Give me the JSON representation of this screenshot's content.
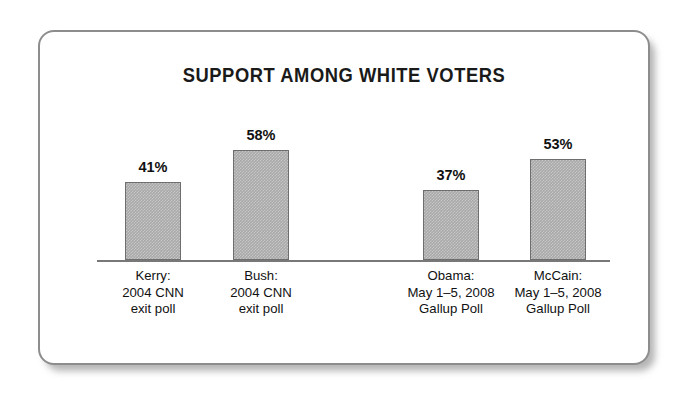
{
  "card": {
    "border_color": "#8d8d8d",
    "background": "#ffffff"
  },
  "chart_data": {
    "type": "bar",
    "title": "SUPPORT AMONG WHITE VOTERS",
    "xlabel": "",
    "ylabel": "",
    "ylim": [
      0,
      65
    ],
    "grid": false,
    "legend": "none",
    "bar_color": "#a9a9a9",
    "bar_border_color": "#6e6e6e",
    "axis_color": "#787878",
    "categories": [
      "Kerry: 2004 CNN exit poll",
      "Bush: 2004 CNN exit poll",
      "Obama: May 1–5, 2008 Gallup Poll",
      "McCain: May 1–5, 2008 Gallup Poll"
    ],
    "values": [
      41,
      58,
      37,
      53
    ],
    "value_labels": [
      "41%",
      "58%",
      "37%",
      "53%"
    ],
    "bars": [
      {
        "value": 41,
        "value_label": "41%",
        "caption_lines": [
          "Kerry:",
          "2004 CNN",
          "exit poll"
        ],
        "group": "2004 CNN exit poll"
      },
      {
        "value": 58,
        "value_label": "58%",
        "caption_lines": [
          "Bush:",
          "2004 CNN",
          "exit poll"
        ],
        "group": "2004 CNN exit poll"
      },
      {
        "value": 37,
        "value_label": "37%",
        "caption_lines": [
          "Obama:",
          "May 1–5, 2008",
          "Gallup Poll"
        ],
        "group": "May 1–5, 2008 Gallup Poll"
      },
      {
        "value": 53,
        "value_label": "53%",
        "caption_lines": [
          "McCain:",
          "May 1–5, 2008",
          "Gallup Poll"
        ],
        "group": "May 1–5, 2008 Gallup Poll"
      }
    ]
  }
}
